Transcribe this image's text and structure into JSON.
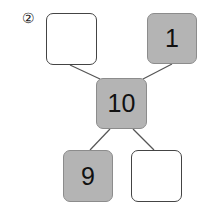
{
  "problem_label": "②",
  "colors": {
    "filled": "#b4b4b4",
    "border": "#8c8c8c",
    "empty": "#ffffff"
  },
  "boxes": {
    "top_left": {
      "value": ""
    },
    "top_right": {
      "value": "1"
    },
    "center": {
      "value": "10"
    },
    "bottom_left": {
      "value": "9"
    },
    "bottom_right": {
      "value": ""
    }
  }
}
